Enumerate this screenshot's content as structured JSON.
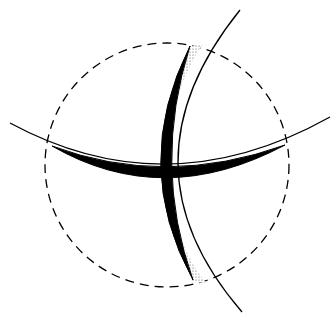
{
  "diagram": {
    "colors": {
      "background": "#ffffff",
      "stroke": "#000000",
      "stipple": "#555555"
    },
    "elements": {
      "dashed_circle": {
        "cx": 167,
        "cy": 165,
        "r": 122,
        "dash": "9 6"
      },
      "horizontal_thin_arc": {
        "path": "M10 123 Q 167 208 330 117"
      },
      "horizontal_crescent": {
        "path": "M52 146 Q 163 210 285 145 Q 165 188 52 146 Z"
      },
      "vertical_thin_arc": {
        "path": "M240 10 Q 115 165 242 312"
      },
      "vertical_crescent": {
        "path": "M190 46 Q 130 165 193 280 Q 152 165 190 46 Z"
      },
      "stipple_top": {
        "path": "M190 46 L203 44 Q 178 80 170 130 Q 166 90 190 46 Z"
      },
      "stipple_bottom": {
        "path": "M172 205 Q 180 250 206 283 L193 282 Q 178 250 172 205 Z"
      }
    }
  }
}
